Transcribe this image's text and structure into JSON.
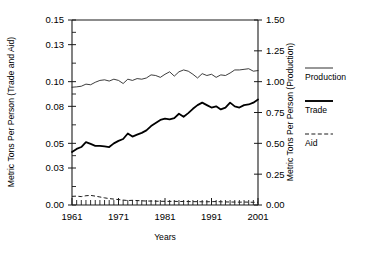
{
  "chart_data": {
    "type": "line",
    "title": "",
    "xlabel": "Years",
    "ylabel": "Metric Tons Per Person (Trade and Aid)",
    "ylabel_right": "Metric Tons Per Person (Production)",
    "xlim": [
      1961,
      2001
    ],
    "ylim": [
      0.0,
      0.15
    ],
    "ylim_right": [
      0.0,
      1.5
    ],
    "grid": false,
    "legend_position": "right",
    "xticks": [
      1961,
      1971,
      1981,
      1991,
      2001
    ],
    "xtick_labels": [
      "1961",
      "1971",
      "1981",
      "1991",
      "2001"
    ],
    "yticks_left": [
      0.0,
      0.03,
      0.05,
      0.08,
      0.1,
      0.13,
      0.15
    ],
    "ytick_labels_left": [
      "0.00",
      "0.03",
      "0.05",
      "0.08",
      "0.10",
      "0.13",
      "0.15"
    ],
    "yticks_right": [
      0.0,
      0.25,
      0.5,
      0.75,
      1.0,
      1.25,
      1.5
    ],
    "ytick_labels_right": [
      "0.00",
      "0.25",
      "0.50",
      "0.75",
      "1.00",
      "1.25",
      "1.50"
    ],
    "x": [
      1961,
      1962,
      1963,
      1964,
      1965,
      1966,
      1967,
      1968,
      1969,
      1970,
      1971,
      1972,
      1973,
      1974,
      1975,
      1976,
      1977,
      1978,
      1979,
      1980,
      1981,
      1982,
      1983,
      1984,
      1985,
      1986,
      1987,
      1988,
      1989,
      1990,
      1991,
      1992,
      1993,
      1994,
      1995,
      1996,
      1997,
      1998,
      1999,
      2000,
      2001
    ],
    "series": [
      {
        "name": "Production",
        "axis": "right",
        "style": "thin-solid",
        "values": [
          0.955,
          0.958,
          0.963,
          0.98,
          0.975,
          0.995,
          1.01,
          1.015,
          1.005,
          1.02,
          1.01,
          0.985,
          1.02,
          1.01,
          1.025,
          1.02,
          1.03,
          1.055,
          1.05,
          1.035,
          1.06,
          1.08,
          1.045,
          1.08,
          1.095,
          1.085,
          1.06,
          1.03,
          1.065,
          1.05,
          1.06,
          1.035,
          1.055,
          1.05,
          1.07,
          1.095,
          1.095,
          1.1,
          1.105,
          1.085,
          1.09
        ]
      },
      {
        "name": "Trade",
        "axis": "left",
        "style": "thick-solid",
        "values": [
          0.043,
          0.0455,
          0.047,
          0.051,
          0.0495,
          0.048,
          0.048,
          0.0475,
          0.047,
          0.05,
          0.052,
          0.0535,
          0.058,
          0.0555,
          0.057,
          0.0585,
          0.0605,
          0.064,
          0.0665,
          0.069,
          0.07,
          0.0695,
          0.0705,
          0.074,
          0.0715,
          0.0745,
          0.078,
          0.081,
          0.083,
          0.081,
          0.079,
          0.08,
          0.0775,
          0.079,
          0.083,
          0.08,
          0.079,
          0.081,
          0.0815,
          0.083,
          0.0855
        ]
      },
      {
        "name": "Aid",
        "axis": "left",
        "style": "dashed",
        "values": [
          0.007,
          0.0072,
          0.0068,
          0.0075,
          0.0078,
          0.0072,
          0.0065,
          0.0058,
          0.0052,
          0.0048,
          0.0044,
          0.004,
          0.0036,
          0.0038,
          0.0036,
          0.0034,
          0.0032,
          0.0032,
          0.0031,
          0.003,
          0.003,
          0.0029,
          0.003,
          0.0028,
          0.0029,
          0.0028,
          0.0027,
          0.0027,
          0.0026,
          0.0026,
          0.0027,
          0.0028,
          0.0026,
          0.0025,
          0.0024,
          0.0024,
          0.0023,
          0.0024,
          0.0023,
          0.0022,
          0.0022
        ]
      }
    ],
    "legend": [
      {
        "label": "Production",
        "style": "thin-solid"
      },
      {
        "label": "Trade",
        "style": "thick-solid"
      },
      {
        "label": "Aid",
        "style": "dashed"
      }
    ]
  }
}
